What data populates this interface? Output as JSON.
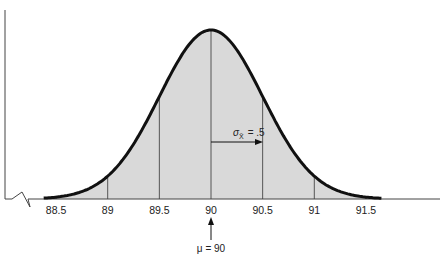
{
  "chart_data": {
    "type": "line",
    "title": "",
    "subtitle": "Sampling distribution of the mean (normal curve)",
    "xlabel": "",
    "ylabel": "",
    "x_ticks": [
      "88.5",
      "89",
      "89.5",
      "90",
      "90.5",
      "91",
      "91.5"
    ],
    "x_range": [
      88.3,
      91.7
    ],
    "mean": 90,
    "std_error": 0.5,
    "grid": false,
    "legend": "none",
    "annotations": {
      "mean_label": "μ = 90",
      "sigma_label_prefix": "σ",
      "sigma_label_sub": "X̄",
      "sigma_label_value": "= .5"
    },
    "curve_points": [
      {
        "x": 88.5,
        "y": 0.0089
      },
      {
        "x": 89.0,
        "y": 0.108
      },
      {
        "x": 89.5,
        "y": 0.4839
      },
      {
        "x": 90.0,
        "y": 0.7979
      },
      {
        "x": 90.5,
        "y": 0.4839
      },
      {
        "x": 91.0,
        "y": 0.108
      },
      {
        "x": 91.5,
        "y": 0.0089
      }
    ],
    "fill_color": "#d9d9d9",
    "curve_color": "#111111"
  }
}
